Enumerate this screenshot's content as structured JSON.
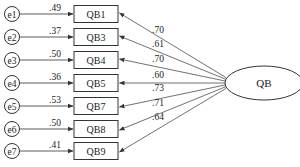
{
  "diagram": {
    "type": "confirmatory-factor-analysis",
    "latent": {
      "label": "QB"
    },
    "indicators": [
      {
        "error": "e1",
        "label": "QB1",
        "error_weight": ".49",
        "loading": ".70"
      },
      {
        "error": "e2",
        "label": "QB3",
        "error_weight": ".37",
        "loading": ".61"
      },
      {
        "error": "e3",
        "label": "QB4",
        "error_weight": ".50",
        "loading": ".70"
      },
      {
        "error": "e4",
        "label": "QB5",
        "error_weight": ".36",
        "loading": ".60"
      },
      {
        "error": "e5",
        "label": "QB7",
        "error_weight": ".53",
        "loading": ".73"
      },
      {
        "error": "e6",
        "label": "QB8",
        "error_weight": ".50",
        "loading": ".71"
      },
      {
        "error": "e7",
        "label": "QB9",
        "error_weight": ".41",
        "loading": ".64"
      }
    ],
    "colors": {
      "stroke": "#333333",
      "text": "#222222",
      "background": "#ffffff"
    }
  }
}
